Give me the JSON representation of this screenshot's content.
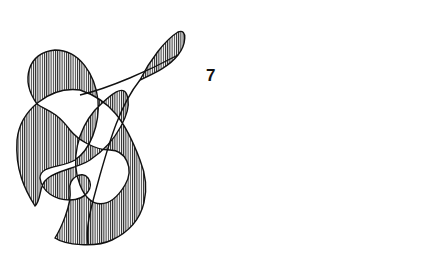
{
  "figure": {
    "label": "7",
    "left_curve": {
      "shading": "vertical-hatch"
    },
    "right_curve": {
      "shading": "vertical-hatch"
    },
    "colors": {
      "ink": "#111111",
      "background": "#ffffff"
    }
  }
}
